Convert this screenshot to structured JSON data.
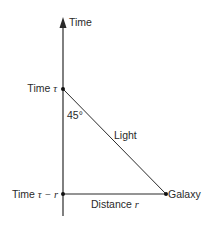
{
  "diagram": {
    "axis_label": "Time",
    "time_tau_label": "Time ",
    "time_tau_symbol": "τ",
    "time_tau_minus_r_label": "Time ",
    "time_tau_minus_r_symbol": "τ − r",
    "angle_label": "45°",
    "light_label": "Light",
    "galaxy_label": "Galaxy",
    "distance_label": "Distance ",
    "distance_symbol": "r",
    "colors": {
      "line": "#2a2a2a",
      "text": "#2a2a2a",
      "background": "#ffffff"
    }
  }
}
